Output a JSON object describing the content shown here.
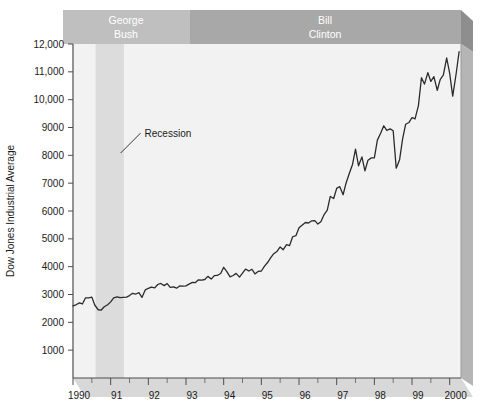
{
  "chart_data": {
    "type": "line",
    "title": "",
    "xlabel": "",
    "ylabel": "Dow Jones Industrial Average",
    "xlim": [
      1990.0,
      2000.3
    ],
    "ylim": [
      0,
      12000
    ],
    "grid": false,
    "legend_position": "none",
    "y_ticks": [
      1000,
      2000,
      3000,
      4000,
      5000,
      6000,
      7000,
      8000,
      9000,
      10000,
      11000,
      12000
    ],
    "y_tick_labels": [
      "1000",
      "2000",
      "3000",
      "4000",
      "5000",
      "6000",
      "7000",
      "8000",
      "9000",
      "10,000",
      "11,000",
      "12,000"
    ],
    "x_ticks": [
      1990,
      1991,
      1992,
      1993,
      1994,
      1995,
      1996,
      1997,
      1998,
      1999,
      2000
    ],
    "x_tick_labels": [
      "1990",
      "91",
      "92",
      "93",
      "94",
      "95",
      "96",
      "97",
      "98",
      "99",
      "2000"
    ],
    "x_minor_ticks": [
      1990.5,
      1991.5,
      1992.5,
      1993.5,
      1994.5,
      1995.5,
      1996.5,
      1997.5,
      1998.5,
      1999.5
    ],
    "series": [
      {
        "name": "Dow Jones Industrial Average",
        "color": "#2b2b2b",
        "x": [
          1990.0,
          1990.08,
          1990.17,
          1990.25,
          1990.33,
          1990.42,
          1990.5,
          1990.58,
          1990.67,
          1990.75,
          1990.83,
          1990.92,
          1991.0,
          1991.08,
          1991.17,
          1991.25,
          1991.33,
          1991.42,
          1991.5,
          1991.58,
          1991.67,
          1991.75,
          1991.83,
          1991.92,
          1992.0,
          1992.08,
          1992.17,
          1992.25,
          1992.33,
          1992.42,
          1992.5,
          1992.58,
          1992.67,
          1992.75,
          1992.83,
          1992.92,
          1993.0,
          1993.08,
          1993.17,
          1993.25,
          1993.33,
          1993.42,
          1993.5,
          1993.58,
          1993.67,
          1993.75,
          1993.83,
          1993.92,
          1994.0,
          1994.08,
          1994.17,
          1994.25,
          1994.33,
          1994.42,
          1994.5,
          1994.58,
          1994.67,
          1994.75,
          1994.83,
          1994.92,
          1995.0,
          1995.08,
          1995.17,
          1995.25,
          1995.33,
          1995.42,
          1995.5,
          1995.58,
          1995.67,
          1995.75,
          1995.83,
          1995.92,
          1996.0,
          1996.08,
          1996.17,
          1996.25,
          1996.33,
          1996.42,
          1996.5,
          1996.58,
          1996.67,
          1996.75,
          1996.83,
          1996.92,
          1997.0,
          1997.08,
          1997.17,
          1997.25,
          1997.33,
          1997.42,
          1997.5,
          1997.58,
          1997.67,
          1997.75,
          1997.83,
          1997.92,
          1998.0,
          1998.08,
          1998.17,
          1998.25,
          1998.33,
          1998.42,
          1998.5,
          1998.58,
          1998.67,
          1998.75,
          1998.83,
          1998.92,
          1999.0,
          1999.08,
          1999.17,
          1999.25,
          1999.33,
          1999.42,
          1999.5,
          1999.58,
          1999.67,
          1999.75,
          1999.83,
          1999.92,
          2000.0,
          2000.08,
          2000.17,
          2000.25
        ],
        "y": [
          2590,
          2630,
          2700,
          2660,
          2876,
          2880,
          2905,
          2614,
          2452,
          2442,
          2560,
          2634,
          2736,
          2882,
          2914,
          2888,
          2900,
          2907,
          2962,
          3044,
          3017,
          3069,
          2895,
          3169,
          3223,
          3268,
          3236,
          3359,
          3397,
          3318,
          3394,
          3257,
          3272,
          3226,
          3305,
          3301,
          3310,
          3371,
          3435,
          3428,
          3527,
          3516,
          3539,
          3651,
          3555,
          3681,
          3684,
          3754,
          3978,
          3832,
          3636,
          3682,
          3758,
          3625,
          3765,
          3913,
          3843,
          3908,
          3739,
          3834,
          3844,
          4011,
          4158,
          4321,
          4465,
          4556,
          4709,
          4610,
          4789,
          4756,
          5075,
          5117,
          5395,
          5486,
          5587,
          5569,
          5643,
          5655,
          5529,
          5616,
          5882,
          6029,
          6522,
          6448,
          6813,
          6878,
          6584,
          7009,
          7331,
          7673,
          8222,
          7622,
          7945,
          7442,
          7823,
          7908,
          7907,
          8546,
          8800,
          9063,
          8900,
          8952,
          8883,
          7539,
          7843,
          8592,
          9116,
          9181,
          9359,
          9307,
          9786,
          10789,
          10560,
          10971,
          10655,
          10829,
          10337,
          10730,
          10878,
          11497,
          10941,
          10128,
          10922,
          11723
        ]
      }
    ],
    "annotations": [
      {
        "name": "recession-band",
        "type": "vspan",
        "label": "Recession",
        "x_start": 1990.6,
        "x_end": 1991.35,
        "color": "#dcdcdc"
      },
      {
        "name": "recession-label",
        "type": "text",
        "text": "Recession",
        "x": 1991.9,
        "y": 8800
      }
    ],
    "period_bands": [
      {
        "name": "george-bush",
        "label_line1": "George",
        "label_line2": "Bush",
        "x_start": 1990.0,
        "x_end": 1993.0,
        "color": "#bfbfbf"
      },
      {
        "name": "bill-clinton",
        "label_line1": "Bill",
        "label_line2": "Clinton",
        "x_start": 1993.0,
        "x_end": 2000.3,
        "color": "#a8a8a8"
      }
    ],
    "colors": {
      "line": "#2b2b2b",
      "plot_background": "#f2f2f2",
      "recession_band": "#dcdcdc",
      "bush_banner": "#bfbfbf",
      "clinton_banner": "#a8a8a8",
      "banner_shadow": "#8f8f8f",
      "axis": "#4d4d4d",
      "text": "#1a1a1a",
      "page_background": "#ffffff"
    }
  }
}
